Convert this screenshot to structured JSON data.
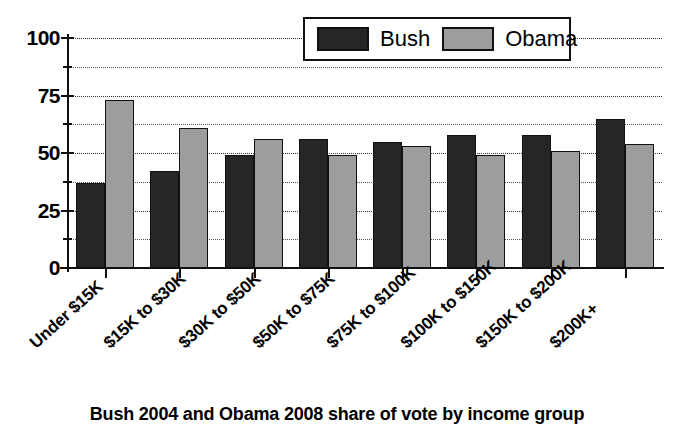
{
  "chart_data": {
    "type": "bar",
    "title": "",
    "caption": "Bush 2004 and Obama 2008 share of vote by income group",
    "xlabel": "",
    "ylabel": "",
    "ylim": [
      0,
      100
    ],
    "yticks": [
      0,
      25,
      50,
      75,
      100
    ],
    "yticklabels": [
      "0",
      "25",
      "50",
      "75",
      "100"
    ],
    "minor_gridlines": [
      12.5,
      37.5,
      62.5,
      87.5
    ],
    "grid": true,
    "legend_position": "top-right",
    "categories": [
      "Under $15K",
      "$15K to $30K",
      "$30K to $50K",
      "$50K to $75K",
      "$75K to $100K",
      "$100K to $150K",
      "$150K to $200K",
      "$200K+"
    ],
    "series": [
      {
        "name": "Bush",
        "color": "#262626",
        "values": [
          37,
          42,
          49,
          56,
          55,
          58,
          58,
          65
        ]
      },
      {
        "name": "Obama",
        "color": "#9d9d9d",
        "values": [
          73,
          61,
          56,
          49,
          53,
          49,
          51,
          54
        ]
      }
    ]
  },
  "legend": {
    "items": [
      {
        "label": "Bush",
        "swatch": "#262626"
      },
      {
        "label": "Obama",
        "swatch": "#9d9d9d"
      }
    ]
  },
  "colors": {
    "bush": "#262626",
    "obama": "#9d9d9d",
    "axis": "#111111",
    "grid": "#333333",
    "background": "#ffffff"
  }
}
